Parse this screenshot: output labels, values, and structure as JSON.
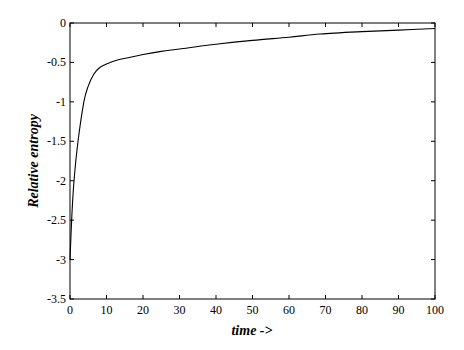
{
  "chart_data": {
    "type": "line",
    "title": "",
    "xlabel": "time ->",
    "ylabel": "Relative entropy",
    "xlim": [
      0,
      100
    ],
    "ylim": [
      -3.5,
      0
    ],
    "xticks": [
      0,
      10,
      20,
      30,
      40,
      50,
      60,
      70,
      80,
      90,
      100
    ],
    "yticks": [
      0,
      -0.5,
      -1,
      -1.5,
      -2,
      -2.5,
      -3,
      -3.5
    ],
    "ytick_labels": [
      "0",
      "-0.5",
      "-1",
      "-1.5",
      "-2",
      "-2.5",
      "-3",
      "-3.5"
    ],
    "grid": false,
    "legend": null,
    "series": [
      {
        "name": "relative entropy",
        "color": "#000000",
        "x": [
          0,
          0.5,
          1.1,
          2.2,
          3.8,
          5,
          6.5,
          8,
          10,
          13,
          16,
          20,
          25,
          30,
          40,
          50,
          60,
          68.5,
          80,
          90,
          100
        ],
        "values": [
          -3.0,
          -2.45,
          -2.0,
          -1.5,
          -1.0,
          -0.8,
          -0.65,
          -0.57,
          -0.52,
          -0.47,
          -0.44,
          -0.4,
          -0.36,
          -0.33,
          -0.27,
          -0.22,
          -0.18,
          -0.14,
          -0.11,
          -0.09,
          -0.07
        ]
      }
    ]
  }
}
